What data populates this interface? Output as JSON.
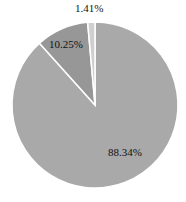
{
  "chart_data": {
    "type": "pie",
    "title": "",
    "categories": [
      "Slice A",
      "Slice B",
      "Slice C"
    ],
    "values": [
      88.34,
      10.25,
      1.41
    ],
    "labels": [
      "88.34%",
      "10.25%",
      "1.41%"
    ],
    "colors": [
      "#a9a9a9",
      "#979797",
      "#cfcfcf"
    ],
    "legend": false
  },
  "labels": {
    "large": "88.34%",
    "medium": "10.25%",
    "small": "1.41%"
  }
}
